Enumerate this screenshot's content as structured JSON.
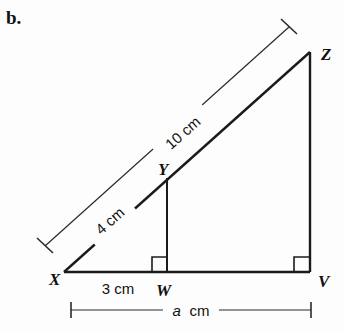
{
  "figure": {
    "part_label": "b.",
    "background_color": "#fdfdfd",
    "stroke_color": "#1b1b1b",
    "vertices": {
      "X": {
        "label": "X",
        "x": 64,
        "y": 272
      },
      "W": {
        "label": "W",
        "x": 167,
        "y": 272
      },
      "V": {
        "label": "V",
        "x": 310,
        "y": 272
      },
      "Y": {
        "label": "Y",
        "x": 167,
        "y": 178
      },
      "Z": {
        "label": "Z",
        "x": 310,
        "y": 52
      }
    },
    "measurements": {
      "hypotenuse_full": "10 cm",
      "hypotenuse_part": "4 cm",
      "base_part": "3 cm",
      "base_full": "a cm",
      "base_full_variable": "a",
      "base_full_unit": "cm"
    },
    "right_angles": [
      {
        "at": "W",
        "note": "right-angle-marker-w"
      },
      {
        "at": "V",
        "note": "right-angle-marker-v"
      }
    ],
    "segments": [
      {
        "name": "XV-base",
        "from": "X",
        "to": "V"
      },
      {
        "name": "XZ-hypotenuse",
        "from": "X",
        "to": "Z"
      },
      {
        "name": "ZV-vertical",
        "from": "Z",
        "to": "V"
      },
      {
        "name": "YW-vertical",
        "from": "Y",
        "to": "W"
      }
    ]
  }
}
